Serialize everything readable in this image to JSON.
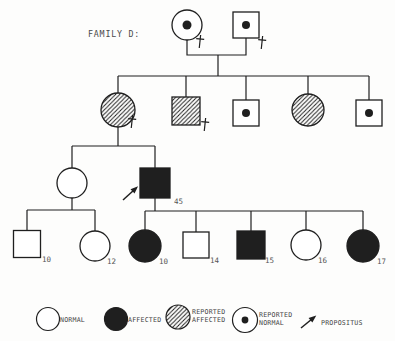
{
  "title": "FAMILY D:",
  "colors": {
    "ink": "#1f1f1f",
    "paper": "#fdfdfc",
    "label_ink": "#4a4a4a"
  },
  "legend_symbol_meanings": {
    "normal": "empty shape",
    "affected": "solid filled shape",
    "reported-affected": "diagonal hatched shape",
    "reported-normal": "shape with center dot"
  },
  "pedigree": {
    "individuals": [
      {
        "id": "I-1",
        "generation": 1,
        "shape": "circle",
        "status": "reported-normal",
        "deceased": true,
        "x": 187,
        "y": 25,
        "size": 15,
        "dot_r": 4.5
      },
      {
        "id": "I-2",
        "generation": 1,
        "shape": "square",
        "status": "reported-normal",
        "deceased": true,
        "x": 246,
        "y": 25,
        "size": 13,
        "dot_r": 4
      },
      {
        "id": "II-1",
        "generation": 2,
        "shape": "circle",
        "status": "reported-affected",
        "deceased": true,
        "x": 118,
        "y": 110,
        "size": 17
      },
      {
        "id": "II-2",
        "generation": 2,
        "shape": "square",
        "status": "reported-affected",
        "deceased": true,
        "x": 186,
        "y": 111,
        "size": 14
      },
      {
        "id": "II-3",
        "generation": 2,
        "shape": "square",
        "status": "reported-normal",
        "x": 246,
        "y": 113,
        "size": 13,
        "dot_r": 4
      },
      {
        "id": "II-4",
        "generation": 2,
        "shape": "circle",
        "status": "reported-affected",
        "x": 308,
        "y": 110,
        "size": 16
      },
      {
        "id": "II-5",
        "generation": 2,
        "shape": "square",
        "status": "reported-normal",
        "x": 369,
        "y": 113,
        "size": 13,
        "dot_r": 4
      },
      {
        "id": "III-1",
        "generation": 3,
        "shape": "circle",
        "status": "normal",
        "x": 72,
        "y": 183,
        "size": 15
      },
      {
        "id": "III-2",
        "generation": 3,
        "shape": "square",
        "status": "affected",
        "propositus": true,
        "x": 155,
        "y": 183,
        "size": 15,
        "label": "45",
        "label_x": 174,
        "label_y": 204
      },
      {
        "id": "IV-1",
        "generation": 4,
        "shape": "square",
        "status": "normal",
        "x": 27,
        "y": 244,
        "size": 13.5,
        "label": "10",
        "label_x": 42,
        "label_y": 262
      },
      {
        "id": "IV-2",
        "generation": 4,
        "shape": "circle",
        "status": "normal",
        "x": 95,
        "y": 246,
        "size": 15,
        "label": "12",
        "label_x": 107,
        "label_y": 264
      },
      {
        "id": "IV-3",
        "generation": 4,
        "shape": "circle",
        "status": "affected",
        "x": 145,
        "y": 246,
        "size": 16,
        "label": "10",
        "label_x": 159,
        "label_y": 264
      },
      {
        "id": "IV-4",
        "generation": 4,
        "shape": "square",
        "status": "normal",
        "x": 196,
        "y": 245,
        "size": 13,
        "label": "14",
        "label_x": 210,
        "label_y": 263
      },
      {
        "id": "IV-5",
        "generation": 4,
        "shape": "square",
        "status": "affected",
        "x": 251,
        "y": 245,
        "size": 14,
        "label": "15",
        "label_x": 265,
        "label_y": 263
      },
      {
        "id": "IV-6",
        "generation": 4,
        "shape": "circle",
        "status": "normal",
        "x": 306,
        "y": 245,
        "size": 15,
        "label": "16",
        "label_x": 318,
        "label_y": 263
      },
      {
        "id": "IV-7",
        "generation": 4,
        "shape": "circle",
        "status": "affected",
        "x": 363,
        "y": 246,
        "size": 16,
        "label": "17",
        "label_x": 377,
        "label_y": 264
      }
    ],
    "lines": [
      [
        187,
        40,
        187,
        55,
        246,
        55,
        246,
        38
      ],
      [
        218,
        55,
        218,
        76
      ],
      [
        118,
        76,
        369,
        76
      ],
      [
        118,
        76,
        118,
        93
      ],
      [
        186,
        76,
        186,
        97
      ],
      [
        246,
        76,
        246,
        100
      ],
      [
        308,
        76,
        308,
        94
      ],
      [
        369,
        76,
        369,
        100
      ],
      [
        118,
        127,
        118,
        146
      ],
      [
        72,
        146,
        155,
        146
      ],
      [
        72,
        146,
        72,
        168
      ],
      [
        155,
        146,
        155,
        168
      ],
      [
        72,
        198,
        72,
        210
      ],
      [
        27,
        210,
        95,
        210
      ],
      [
        27,
        210,
        27,
        230
      ],
      [
        95,
        210,
        95,
        231
      ],
      [
        155,
        198,
        155,
        211
      ],
      [
        145,
        211,
        363,
        211
      ],
      [
        145,
        211,
        145,
        230
      ],
      [
        196,
        211,
        196,
        232
      ],
      [
        251,
        211,
        251,
        231
      ],
      [
        306,
        211,
        306,
        231
      ],
      [
        363,
        211,
        363,
        230
      ]
    ],
    "daggers": [
      {
        "x": 200,
        "y": 41
      },
      {
        "x": 262,
        "y": 42
      },
      {
        "x": 132,
        "y": 121
      },
      {
        "x": 205,
        "y": 124
      }
    ],
    "propositus_arrow": {
      "x1": 123,
      "y1": 200,
      "x2": 134,
      "y2": 190
    }
  },
  "legend": {
    "items": [
      {
        "symbol": "circle",
        "status": "normal",
        "x": 48,
        "y": 319,
        "r": 11.5,
        "label_lines": [
          "NORMAL"
        ],
        "label_x": 60,
        "label_y": 322
      },
      {
        "symbol": "circle",
        "status": "affected",
        "x": 116,
        "y": 319,
        "r": 11.5,
        "label_lines": [
          "AFFECTED"
        ],
        "label_x": 128,
        "label_y": 322
      },
      {
        "symbol": "circle",
        "status": "reported-affected",
        "x": 178,
        "y": 317,
        "r": 12,
        "label_lines": [
          "REPORTED",
          "AFFECTED"
        ],
        "label_x": 192,
        "label_y": 314
      },
      {
        "symbol": "circle",
        "status": "reported-normal",
        "x": 245,
        "y": 320,
        "r": 12.5,
        "dot_r": 3.4,
        "label_lines": [
          "REPORTED",
          "NORMAL"
        ],
        "label_x": 259,
        "label_y": 317
      },
      {
        "symbol": "arrow",
        "status": "propositus",
        "arrow": {
          "x1": 301,
          "y1": 328,
          "x2": 312,
          "y2": 319
        },
        "label_lines": [
          "PROPOSITUS"
        ],
        "label_x": 321,
        "label_y": 325
      }
    ]
  }
}
